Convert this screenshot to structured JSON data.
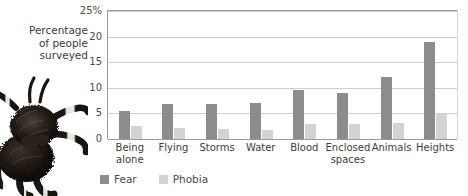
{
  "axis_title": "Percentage\nof people\nsurveyed",
  "image": {
    "spider_photo": "tarantula-photo"
  },
  "legend": {
    "position": "bottom-left",
    "items": [
      {
        "label": "Fear",
        "color": "#8c8c8c"
      },
      {
        "label": "Phobia",
        "color": "#d3d3d3"
      }
    ]
  },
  "chart_data": {
    "type": "bar",
    "title": "",
    "xlabel": "",
    "ylabel": "Percentage of people surveyed",
    "ylim": [
      0,
      25
    ],
    "yticks": [
      0,
      5,
      10,
      15,
      20,
      25
    ],
    "ytick_labels": [
      "0",
      "5",
      "10",
      "15",
      "20",
      "25%"
    ],
    "grid": true,
    "categories": [
      "Being\nalone",
      "Flying",
      "Storms",
      "Water",
      "Blood",
      "Enclosed\nspaces",
      "Animals",
      "Heights"
    ],
    "series": [
      {
        "name": "Fear",
        "color": "#8c8c8c",
        "values": [
          5.5,
          6.8,
          6.8,
          7.0,
          9.5,
          9.0,
          12.2,
          19.0
        ]
      },
      {
        "name": "Phobia",
        "color": "#d3d3d3",
        "values": [
          2.5,
          2.2,
          1.9,
          1.8,
          3.0,
          3.0,
          3.2,
          5.0
        ]
      }
    ]
  }
}
